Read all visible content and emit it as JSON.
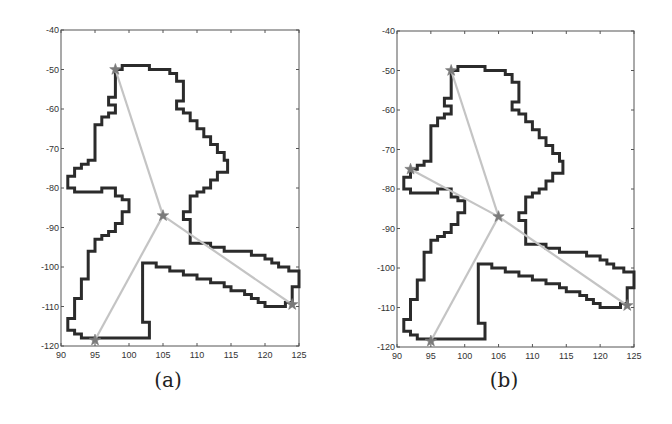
{
  "chart_data": [
    {
      "type": "line",
      "panel": "a",
      "caption": "(a)",
      "title": "",
      "xlabel": "",
      "ylabel": "",
      "xlim": [
        90,
        125
      ],
      "ylim": [
        -120,
        -40
      ],
      "xticks": [
        90,
        95,
        100,
        105,
        110,
        115,
        120,
        125
      ],
      "yticks": [
        -40,
        -50,
        -60,
        -70,
        -80,
        -90,
        -100,
        -110,
        -120
      ],
      "grid": false,
      "legend": null,
      "series": [
        {
          "name": "region-contour",
          "style": "thick-dark-staircase",
          "color": "#2b2b2b",
          "points": [
            [
              98,
              -50
            ],
            [
              99,
              -50
            ],
            [
              99,
              -49
            ],
            [
              103,
              -49
            ],
            [
              103,
              -50
            ],
            [
              106,
              -50
            ],
            [
              106,
              -51
            ],
            [
              107,
              -51
            ],
            [
              107,
              -53
            ],
            [
              108,
              -53
            ],
            [
              108,
              -58
            ],
            [
              107,
              -58
            ],
            [
              107,
              -60
            ],
            [
              108,
              -60
            ],
            [
              108,
              -61
            ],
            [
              109,
              -61
            ],
            [
              109,
              -63
            ],
            [
              110,
              -63
            ],
            [
              110,
              -65
            ],
            [
              111,
              -65
            ],
            [
              111,
              -67
            ],
            [
              112,
              -67
            ],
            [
              112,
              -69
            ],
            [
              113,
              -69
            ],
            [
              113,
              -71
            ],
            [
              114,
              -71
            ],
            [
              114,
              -73
            ],
            [
              114.5,
              -73
            ],
            [
              114.5,
              -76
            ],
            [
              113,
              -76
            ],
            [
              113,
              -78
            ],
            [
              112,
              -78
            ],
            [
              112,
              -80
            ],
            [
              111,
              -80
            ],
            [
              111,
              -81
            ],
            [
              110,
              -81
            ],
            [
              110,
              -82
            ],
            [
              109,
              -82
            ],
            [
              109,
              -86
            ],
            [
              108,
              -86
            ],
            [
              108,
              -88
            ],
            [
              109,
              -88
            ],
            [
              109,
              -94
            ],
            [
              112,
              -94
            ],
            [
              112,
              -95
            ],
            [
              114,
              -95
            ],
            [
              114,
              -96
            ],
            [
              118,
              -96
            ],
            [
              118,
              -97
            ],
            [
              120,
              -97
            ],
            [
              120,
              -98
            ],
            [
              121,
              -98
            ],
            [
              121,
              -99
            ],
            [
              122,
              -99
            ],
            [
              122,
              -100
            ],
            [
              123.5,
              -100
            ],
            [
              123.5,
              -101
            ],
            [
              125,
              -101
            ],
            [
              125,
              -105
            ],
            [
              124,
              -105
            ],
            [
              124,
              -109
            ],
            [
              123,
              -109
            ],
            [
              123,
              -110
            ],
            [
              120,
              -110
            ],
            [
              120,
              -109
            ],
            [
              119,
              -109
            ],
            [
              119,
              -108
            ],
            [
              118,
              -108
            ],
            [
              118,
              -107
            ],
            [
              117,
              -107
            ],
            [
              117,
              -106
            ],
            [
              115,
              -106
            ],
            [
              115,
              -105
            ],
            [
              114,
              -105
            ],
            [
              114,
              -104
            ],
            [
              112,
              -104
            ],
            [
              112,
              -103
            ],
            [
              110,
              -103
            ],
            [
              110,
              -102
            ],
            [
              108,
              -102
            ],
            [
              108,
              -101
            ],
            [
              106,
              -101
            ],
            [
              106,
              -100
            ],
            [
              104,
              -100
            ],
            [
              104,
              -99
            ],
            [
              102,
              -99
            ],
            [
              102,
              -114
            ],
            [
              103,
              -114
            ],
            [
              103,
              -118
            ],
            [
              93,
              -118
            ],
            [
              93,
              -117
            ],
            [
              92,
              -117
            ],
            [
              92,
              -116
            ],
            [
              91,
              -116
            ],
            [
              91,
              -113
            ],
            [
              92,
              -113
            ],
            [
              92,
              -108
            ],
            [
              93,
              -108
            ],
            [
              93,
              -103
            ],
            [
              94,
              -103
            ],
            [
              94,
              -96
            ],
            [
              95,
              -96
            ],
            [
              95,
              -93
            ],
            [
              96,
              -93
            ],
            [
              96,
              -92
            ],
            [
              97,
              -92
            ],
            [
              97,
              -91
            ],
            [
              98,
              -91
            ],
            [
              98,
              -89
            ],
            [
              99,
              -89
            ],
            [
              99,
              -86
            ],
            [
              100,
              -86
            ],
            [
              100,
              -83
            ],
            [
              99,
              -83
            ],
            [
              99,
              -82
            ],
            [
              98,
              -82
            ],
            [
              98,
              -80
            ],
            [
              96,
              -80
            ],
            [
              96,
              -81
            ],
            [
              92,
              -81
            ],
            [
              92,
              -80
            ],
            [
              91,
              -80
            ],
            [
              91,
              -77
            ],
            [
              92,
              -77
            ],
            [
              92,
              -75
            ],
            [
              93,
              -75
            ],
            [
              93,
              -74
            ],
            [
              94,
              -74
            ],
            [
              94,
              -73
            ],
            [
              95,
              -73
            ],
            [
              95,
              -64
            ],
            [
              96,
              -64
            ],
            [
              96,
              -62
            ],
            [
              97,
              -62
            ],
            [
              97,
              -61
            ],
            [
              98,
              -61
            ],
            [
              98,
              -59
            ],
            [
              97,
              -59
            ],
            [
              97,
              -57
            ],
            [
              98,
              -57
            ],
            [
              98,
              -50
            ]
          ]
        },
        {
          "name": "skeleton-edges",
          "style": "light-gray-segments",
          "color": "#c4c4c4",
          "segments": [
            [
              [
                105,
                -87
              ],
              [
                98,
                -50
              ]
            ],
            [
              [
                105,
                -87
              ],
              [
                95,
                -118.5
              ]
            ],
            [
              [
                105,
                -87
              ],
              [
                124,
                -109.5
              ]
            ]
          ]
        },
        {
          "name": "nodes",
          "style": "star-markers",
          "color": "#7a7a7a",
          "points": [
            [
              98,
              -50
            ],
            [
              105,
              -87
            ],
            [
              95,
              -118.5
            ],
            [
              124,
              -109.5
            ]
          ]
        }
      ]
    },
    {
      "type": "line",
      "panel": "b",
      "caption": "(b)",
      "title": "",
      "xlabel": "",
      "ylabel": "",
      "xlim": [
        90,
        125
      ],
      "ylim": [
        -120,
        -40
      ],
      "xticks": [
        90,
        95,
        100,
        106,
        110,
        115,
        120,
        125
      ],
      "yticks": [
        -40,
        -50,
        -60,
        -70,
        -80,
        -90,
        -100,
        -110,
        -120
      ],
      "grid": false,
      "legend": null,
      "series": [
        {
          "name": "region-contour",
          "style": "thick-dark-staircase",
          "color": "#2b2b2b",
          "same_as_panel": "a"
        },
        {
          "name": "skeleton-edges",
          "style": "light-gray-segments",
          "color": "#c4c4c4",
          "segments": [
            [
              [
                105,
                -87
              ],
              [
                98,
                -50
              ]
            ],
            [
              [
                105,
                -87
              ],
              [
                95,
                -118.5
              ]
            ],
            [
              [
                105,
                -87
              ],
              [
                124,
                -109.5
              ]
            ],
            [
              [
                105,
                -87
              ],
              [
                92,
                -75
              ]
            ]
          ]
        },
        {
          "name": "nodes",
          "style": "star-markers",
          "color": "#7a7a7a",
          "points": [
            [
              98,
              -50
            ],
            [
              92,
              -75
            ],
            [
              105,
              -87
            ],
            [
              95,
              -118.5
            ],
            [
              124,
              -109.5
            ]
          ]
        }
      ]
    }
  ],
  "captions": {
    "a": "(a)",
    "b": "(b)"
  }
}
